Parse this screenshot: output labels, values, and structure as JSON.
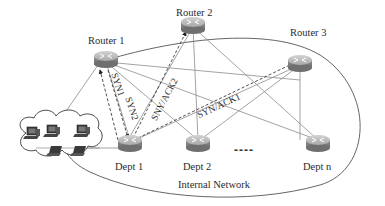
{
  "diagram": {
    "type": "network-topology",
    "routers": [
      {
        "id": "router1",
        "label": "Router 1"
      },
      {
        "id": "router2",
        "label": "Router 2"
      },
      {
        "id": "router3",
        "label": "Router 3"
      }
    ],
    "departments": [
      {
        "id": "dept1",
        "label": "Dept 1"
      },
      {
        "id": "dept2",
        "label": "Dept 2"
      },
      {
        "id": "deptn",
        "label": "Dept n"
      }
    ],
    "ellipsis": "----",
    "network_label": "Internal Network",
    "messages": [
      {
        "id": "syn1",
        "label": "SYN1",
        "from": "dept1",
        "to": "router1",
        "style": "dashed"
      },
      {
        "id": "syn2",
        "label": "SYN2",
        "from": "router1",
        "to": "dept1",
        "style": "dashed"
      },
      {
        "id": "synack2",
        "label": "SNY/ACK2",
        "from": "dept1",
        "to": "router2",
        "style": "dashed"
      },
      {
        "id": "synack1",
        "label": "SYN/ACK1",
        "from": "dept1",
        "to": "router3",
        "style": "dashed"
      }
    ],
    "client_cloud": {
      "desktops": 3,
      "laptops": 2
    },
    "colors": {
      "router_top": "#b9b9b9",
      "router_side": "#8a8a8a",
      "line": "#8c8c8c",
      "ellipse": "#555555",
      "text": "#2b2b2b"
    }
  }
}
